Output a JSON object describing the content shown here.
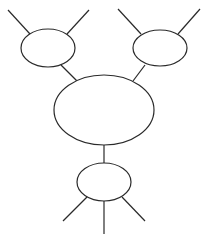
{
  "diagram": {
    "type": "tree-of-ellipses",
    "stroke_color": "#2a2a2a",
    "background": "#ffffff",
    "nodes": [
      {
        "id": "top-left",
        "cx": 48,
        "cy": 48,
        "rx": 27,
        "ry": 19
      },
      {
        "id": "top-right",
        "cx": 160,
        "cy": 48,
        "rx": 27,
        "ry": 18
      },
      {
        "id": "center",
        "cx": 104,
        "cy": 110,
        "rx": 50,
        "ry": 35
      },
      {
        "id": "bottom",
        "cx": 104,
        "cy": 182,
        "rx": 27,
        "ry": 19
      }
    ],
    "edges": [
      {
        "id": "tl-out-left",
        "x1": 8,
        "y1": 10,
        "x2": 30,
        "y2": 34
      },
      {
        "id": "tl-out-right",
        "x1": 89,
        "y1": 10,
        "x2": 67,
        "y2": 34
      },
      {
        "id": "tr-out-left",
        "x1": 118,
        "y1": 9,
        "x2": 141,
        "y2": 34
      },
      {
        "id": "tr-out-right",
        "x1": 200,
        "y1": 9,
        "x2": 178,
        "y2": 34
      },
      {
        "id": "tl-to-center",
        "x1": 61,
        "y1": 65,
        "x2": 77,
        "y2": 81
      },
      {
        "id": "tr-to-center",
        "x1": 145,
        "y1": 65,
        "x2": 133,
        "y2": 81
      },
      {
        "id": "center-to-bottom",
        "x1": 104,
        "y1": 145,
        "x2": 104,
        "y2": 163
      },
      {
        "id": "bottom-out-left",
        "x1": 87,
        "y1": 197,
        "x2": 63,
        "y2": 221
      },
      {
        "id": "bottom-out-middle",
        "x1": 104,
        "y1": 201,
        "x2": 104,
        "y2": 234
      },
      {
        "id": "bottom-out-right",
        "x1": 122,
        "y1": 197,
        "x2": 145,
        "y2": 221
      }
    ]
  }
}
